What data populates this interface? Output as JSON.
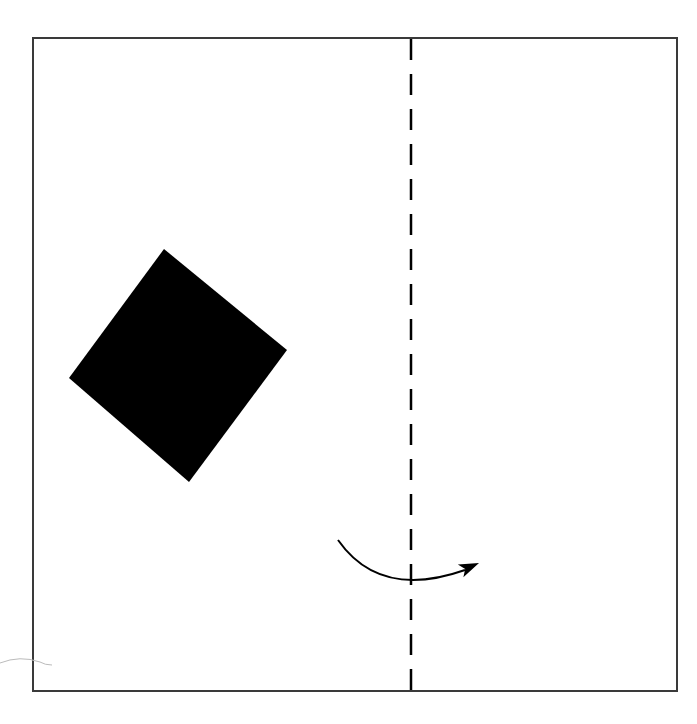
{
  "diagram": {
    "frame": {
      "x": 33,
      "y": 38,
      "width": 644,
      "height": 653,
      "stroke": "#3a3a3a",
      "stroke_width": 2
    },
    "shape": {
      "type": "rotated-square",
      "fill": "#000000",
      "points": [
        [
          164,
          249
        ],
        [
          287,
          350
        ],
        [
          189,
          482
        ],
        [
          69,
          378
        ]
      ]
    },
    "axis_line": {
      "type": "dashed-vertical",
      "x": 411,
      "y1": 39,
      "y2": 690,
      "stroke": "#000000",
      "stroke_width": 2.5,
      "dash": "21 14"
    },
    "arrow": {
      "type": "curved-arrow",
      "direction": "left-to-right",
      "path": "M 338 540 Q 380 600 465 570",
      "stroke": "#000000",
      "stroke_width": 2,
      "head_tip": [
        479,
        563
      ]
    },
    "stray_mark": {
      "path": "M 0 663 Q 20 655 40 662 Q 45 665 52 665",
      "stroke": "#bbbbbb"
    }
  }
}
